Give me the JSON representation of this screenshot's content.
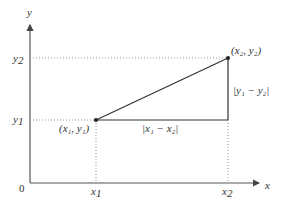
{
  "diagram": {
    "axes": {
      "x_label": "x",
      "y_label": "y",
      "origin_label": "0"
    },
    "ticks": {
      "x1": "x",
      "x1_sub": "1",
      "x2": "x",
      "x2_sub": "2",
      "y1": "y",
      "y1_sub": "1",
      "y2": "y",
      "y2_sub": "2"
    },
    "points": [
      {
        "label": "(x₁, y₁)",
        "x": 96,
        "y": 120
      },
      {
        "label": "(x₂, y₂)",
        "x": 228,
        "y": 58
      }
    ],
    "segments": {
      "horizontal_label": "|x₁ − x₂|",
      "vertical_label": "|y₁ − y₂|"
    },
    "colors": {
      "line": "#333333",
      "dotted": "#999999"
    }
  }
}
